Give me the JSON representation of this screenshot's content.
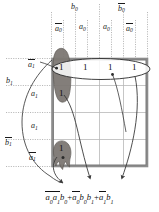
{
  "figure": {
    "kind": "karnaugh-map",
    "grid": {
      "rows": 4,
      "cols": 4
    }
  },
  "colors": {
    "grid_border": "#8c8c8c",
    "grid_line": "#b4b4b4",
    "guide_line": "#9a9a9a",
    "blob_fill": "#7d7873",
    "blob_stroke": "#5c5853",
    "ellipse_stroke": "#2b2b2b",
    "arrow": "#3a3a3a",
    "text": "#1a1a1a",
    "background": "#ffffff"
  },
  "top_labels": {
    "row1": [
      {
        "id": "b0",
        "base": "b",
        "sub": "0",
        "bar": false,
        "x": 75,
        "y": 7
      },
      {
        "id": "nb0",
        "base": "b",
        "sub": "0",
        "bar": true,
        "x": 122,
        "y": 7
      }
    ],
    "row2": [
      {
        "id": "na0-left",
        "base": "a",
        "sub": "0",
        "bar": true,
        "x": 58,
        "y": 27
      },
      {
        "id": "a0-midleft",
        "base": "a",
        "sub": "0",
        "bar": false,
        "x": 82,
        "y": 27
      },
      {
        "id": "a0-midright",
        "base": "a",
        "sub": "0",
        "bar": false,
        "x": 106,
        "y": 27
      },
      {
        "id": "na0-right",
        "base": "a",
        "sub": "0",
        "bar": true,
        "x": 129,
        "y": 27
      }
    ]
  },
  "left_labels": [
    {
      "id": "na1-top",
      "base": "a",
      "sub": "1",
      "bar": true,
      "x": 30,
      "y": 63
    },
    {
      "id": "b1",
      "base": "b",
      "sub": "1",
      "bar": false,
      "x": 8,
      "y": 80
    },
    {
      "id": "a1-upper",
      "base": "a",
      "sub": "1",
      "bar": false,
      "x": 33,
      "y": 94
    },
    {
      "id": "a1-lower",
      "base": "a",
      "sub": "1",
      "bar": false,
      "x": 33,
      "y": 126
    },
    {
      "id": "nb1",
      "base": "b",
      "sub": "1",
      "bar": true,
      "x": 7,
      "y": 142
    },
    {
      "id": "na1-bottom",
      "base": "a",
      "sub": "1",
      "bar": true,
      "x": 31,
      "y": 156
    }
  ],
  "cells": [
    {
      "id": "r0c0",
      "value": "1",
      "row": 0,
      "col": 0,
      "x": 61,
      "y": 67,
      "on_blob": true
    },
    {
      "id": "r0c1",
      "value": "1",
      "row": 0,
      "col": 1,
      "x": 85,
      "y": 67,
      "on_blob": false
    },
    {
      "id": "r0c2",
      "value": "1",
      "row": 0,
      "col": 2,
      "x": 110,
      "y": 67,
      "on_blob": false
    },
    {
      "id": "r0c3",
      "value": "1",
      "row": 0,
      "col": 3,
      "x": 134,
      "y": 67,
      "on_blob": false
    },
    {
      "id": "r1c0",
      "value": "1",
      "row": 1,
      "col": 0,
      "x": 61,
      "y": 93,
      "on_blob": true
    },
    {
      "id": "r3c0",
      "value": "1",
      "row": 3,
      "col": 0,
      "x": 61,
      "y": 148,
      "on_blob": true
    }
  ],
  "groups": [
    {
      "id": "group-row0",
      "shape": "ellipse",
      "label": "a1-bar-b1-group",
      "cx": 101,
      "cy": 69,
      "rx": 49,
      "ry": 10.5
    },
    {
      "id": "group-col0-top",
      "shape": "blob",
      "label": "a0-bar-b0-b1-group",
      "cx": 61,
      "cy": 72
    },
    {
      "id": "group-col0-bottom",
      "shape": "blob",
      "label": "a0-bar-a1-bar-b0-group",
      "cx": 61,
      "cy": 152
    }
  ],
  "equation": {
    "terms": [
      {
        "factors": [
          {
            "base": "a",
            "sub": "0",
            "bar": true
          },
          {
            "base": "a",
            "sub": "1",
            "bar": true
          },
          {
            "base": "b",
            "sub": "0",
            "bar": false
          }
        ]
      },
      {
        "factors": [
          {
            "base": "a",
            "sub": "0",
            "bar": true
          },
          {
            "base": "b",
            "sub": "0",
            "bar": false
          },
          {
            "base": "b",
            "sub": "1",
            "bar": false
          }
        ]
      },
      {
        "factors": [
          {
            "base": "a",
            "sub": "1",
            "bar": true
          },
          {
            "base": "b",
            "sub": "1",
            "bar": false
          }
        ]
      }
    ],
    "operator": "+",
    "plain_text": "a0'a1'b0 + a0'b0b1 + a1'b1"
  },
  "annotations": {
    "arrow_count": 3,
    "arrow_targets": "equation terms"
  }
}
